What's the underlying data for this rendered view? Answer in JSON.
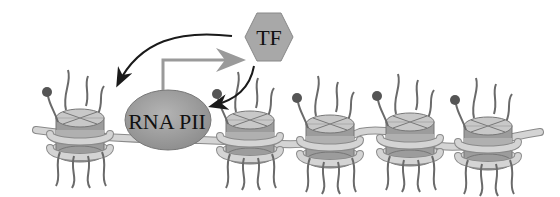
{
  "diagram": {
    "nodes": {
      "tf": {
        "label": "TF",
        "shape": "hexagon",
        "fill": "#a8a8a8"
      },
      "rna_pii": {
        "label": "RNA PII",
        "shape": "ellipse",
        "fill": "#9a9a9a"
      }
    },
    "edges": [
      {
        "from": "TF",
        "to": "upstream nucleosome",
        "style": "black curved arrow"
      },
      {
        "from": "TF",
        "to": "RNA PII",
        "style": "black curved arrow"
      },
      {
        "from": "RNA PII",
        "to": "TF",
        "style": "gray elbow arrow"
      }
    ],
    "nucleosome_count": 5,
    "colors": {
      "dna": "#d4d4d4",
      "dna_outline": "#8a8a8a",
      "histone_light": "#c8c8c8",
      "histone_dark": "#9c9c9c",
      "tail": "#6a6a6a",
      "tail_mark": "#555555",
      "black_arrow": "#1a1a1a",
      "gray_arrow": "#9a9a9a"
    }
  }
}
